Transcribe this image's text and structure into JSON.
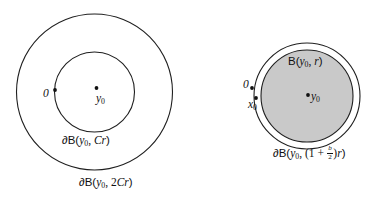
{
  "figure": {
    "background_color": "#ffffff",
    "stroke_color": "#1f1f1f",
    "fill_gray": "#c9c9c9",
    "left_panel": {
      "name": "concentric annulus diagram",
      "outer_circle": {
        "cx": 94.5,
        "cy": 92,
        "r": 78,
        "label": "∂B(y₀, 2Cr)"
      },
      "inner_circle": {
        "cx": 94.5,
        "cy": 92,
        "r": 40,
        "label": "∂B(y₀, Cr)"
      },
      "points": [
        {
          "id": "origin",
          "label": "0",
          "cx": 55,
          "cy": 90
        },
        {
          "id": "center",
          "label": "y₀",
          "cx": 96.5,
          "cy": 88
        }
      ],
      "labels": {
        "origin": "0",
        "center_base": "y",
        "center_sub": "0",
        "inner_boundary_prefix": "∂B(",
        "inner_boundary_arg_base": "y",
        "inner_boundary_arg_sub": "0",
        "inner_boundary_sep": ", ",
        "inner_boundary_radius": "Cr",
        "inner_boundary_suffix": ")",
        "outer_boundary_prefix": "∂B(",
        "outer_boundary_arg_base": "y",
        "outer_boundary_arg_sub": "0",
        "outer_boundary_sep": ", ",
        "outer_boundary_radius_coef": "2",
        "outer_boundary_radius": "Cr",
        "outer_boundary_suffix": ")"
      }
    },
    "right_panel": {
      "name": "filled ball with thin outer boundary",
      "outer_circle": {
        "cx": 307,
        "cy": 96,
        "r": 53,
        "label": "∂B(y₀, (1 + b/2)r)"
      },
      "inner_circle": {
        "cx": 307,
        "cy": 96,
        "r": 46,
        "label": "B(y₀, r)",
        "filled": true
      },
      "points": [
        {
          "id": "origin",
          "label": "0",
          "cx": 252,
          "cy": 88
        },
        {
          "id": "x0",
          "label": "x₀",
          "cx": 256,
          "cy": 98
        },
        {
          "id": "center",
          "label": "y₀",
          "cx": 308,
          "cy": 95
        }
      ],
      "labels": {
        "origin": "0",
        "x0_base": "x",
        "x0_sub": "0",
        "center_base": "y",
        "center_sub": "0",
        "ball_prefix": "B(",
        "ball_arg_base": "y",
        "ball_arg_sub": "0",
        "ball_sep": ", ",
        "ball_radius": "r",
        "ball_suffix": ")",
        "boundary_prefix": "∂B(",
        "boundary_arg_base": "y",
        "boundary_arg_sub": "0",
        "boundary_sep": ", (",
        "boundary_one": "1",
        "boundary_plus": " + ",
        "frac_num": "b",
        "frac_den": "2",
        "boundary_close_paren": ")",
        "boundary_radius": "r",
        "boundary_suffix": ")"
      }
    }
  }
}
